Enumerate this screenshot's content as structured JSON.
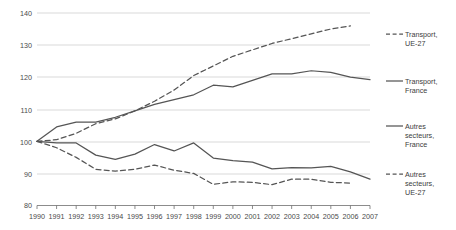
{
  "chart_data": {
    "type": "line",
    "title": "",
    "subtitle": "",
    "xlabel": "",
    "ylabel": "",
    "xlim": [
      1990,
      2007
    ],
    "ylim": [
      80,
      140
    ],
    "grid": true,
    "legend_position": "right",
    "x": [
      1990,
      1991,
      1992,
      1993,
      1994,
      1995,
      1996,
      1997,
      1998,
      1999,
      2000,
      2001,
      2002,
      2003,
      2004,
      2005,
      2006,
      2007
    ],
    "categories": [
      "1990",
      "1991",
      "1992",
      "1993",
      "1994",
      "1995",
      "1996",
      "1997",
      "1998",
      "1999",
      "2000",
      "2001",
      "2002",
      "2003",
      "2004",
      "2005",
      "2006",
      "2007"
    ],
    "y_ticks": [
      80,
      90,
      100,
      110,
      120,
      130,
      140
    ],
    "y_tick_labels": [
      "80",
      "90",
      "100",
      "110",
      "120",
      "130",
      "140"
    ],
    "series": [
      {
        "name": "Transport, UE-27",
        "style": "dashed",
        "color": "#555555",
        "values": [
          100,
          100.5,
          102.5,
          105.5,
          107,
          109.5,
          112.5,
          116,
          120.5,
          123.5,
          126.5,
          128.5,
          130.5,
          132,
          133.5,
          135,
          136,
          null
        ]
      },
      {
        "name": "Transport, France",
        "style": "solid",
        "color": "#555555",
        "values": [
          100,
          104.5,
          106,
          106,
          107.5,
          109.5,
          111.5,
          113,
          114.5,
          117.5,
          117,
          119,
          121,
          121,
          122,
          121.5,
          120,
          119.2
        ]
      },
      {
        "name": "Autres secteurs, France",
        "style": "solid",
        "color": "#555555",
        "values": [
          100,
          99.5,
          99.5,
          95.7,
          94.4,
          96,
          99,
          97,
          99.5,
          94.8,
          94,
          93.5,
          91.4,
          91.8,
          91.7,
          92.2,
          90.5,
          88.2
        ]
      },
      {
        "name": "Autres secteurs, UE-27",
        "style": "dashed",
        "color": "#555555",
        "values": [
          100,
          98,
          95,
          91.3,
          90.7,
          91.3,
          92.6,
          91,
          90,
          86.6,
          87.4,
          87.2,
          86.5,
          88.2,
          88.2,
          87.2,
          87,
          null
        ]
      }
    ],
    "legend": [
      {
        "label_line1": "Transport,",
        "label_line2": "UE-27",
        "label_line3": "",
        "style": "dashed"
      },
      {
        "label_line1": "Transport,",
        "label_line2": "France",
        "label_line3": "",
        "style": "solid"
      },
      {
        "label_line1": "Autres",
        "label_line2": "secteurs,",
        "label_line3": "France",
        "style": "solid"
      },
      {
        "label_line1": "Autres",
        "label_line2": "secteurs,",
        "label_line3": "UE-27",
        "style": "dashed"
      }
    ],
    "colors": {
      "line": "#555555",
      "grid": "#c8c8c8",
      "axis": "#6e6e6e",
      "text": "#3c3c3c",
      "background": "#ffffff"
    }
  }
}
